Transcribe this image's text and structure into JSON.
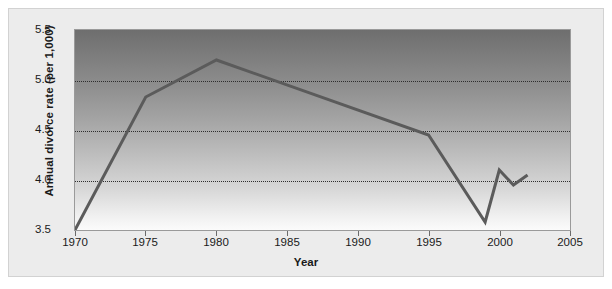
{
  "chart_data": {
    "type": "line",
    "title": "",
    "xlabel": "Year",
    "ylabel": "Annual divorce rate (per 1,000)",
    "xlim": [
      1970,
      2005
    ],
    "ylim": [
      3.5,
      5.5
    ],
    "xticks": [
      "1970",
      "1975",
      "1980",
      "1985",
      "1990",
      "1995",
      "2000",
      "2005"
    ],
    "xtick_values": [
      1970,
      1975,
      1980,
      1985,
      1990,
      1995,
      2000,
      2005
    ],
    "yticks": [
      "3.5",
      "4.0",
      "4.5",
      "5.0",
      "5.5"
    ],
    "ytick_values": [
      3.5,
      4.0,
      4.5,
      5.0,
      5.5
    ],
    "gridlines": {
      "horizontal_at": [
        4.0,
        4.5,
        5.0
      ],
      "style": "dotted",
      "vertical": false
    },
    "legend": null,
    "series": [
      {
        "name": "Annual divorce rate",
        "color": "#5b5b5b",
        "x": [
          1970,
          1975,
          1980,
          1995,
          1999,
          2000,
          2001,
          2002
        ],
        "values": [
          3.5,
          4.83,
          5.2,
          4.45,
          3.58,
          4.1,
          3.95,
          4.05
        ]
      }
    ],
    "plot_background": "gradient dark-gray to white, top to bottom",
    "line_color": "#5b5b5b",
    "panel_color": "#ececec"
  },
  "axes": {
    "y_title": "Annual divorce rate (per 1,000)",
    "x_title": "Year",
    "y_tick_labels": [
      "5.5",
      "5.0",
      "4.5",
      "4.0",
      "3.5"
    ],
    "x_tick_labels": [
      "1970",
      "1975",
      "1980",
      "1985",
      "1990",
      "1995",
      "2000",
      "2005"
    ]
  }
}
